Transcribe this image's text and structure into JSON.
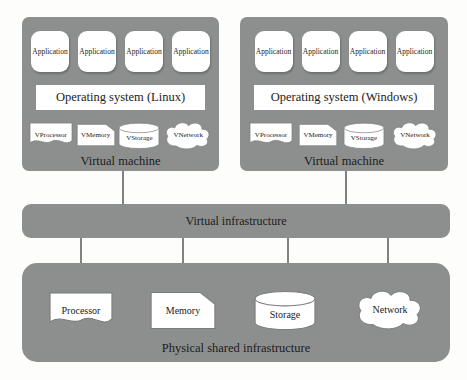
{
  "figure": {
    "vms": [
      {
        "apps": [
          "Application",
          "Application",
          "Application",
          "Application"
        ],
        "os": "Operating system (Linux)",
        "resources": [
          {
            "label": "VProcessor",
            "shape": "wave"
          },
          {
            "label": "VMemory",
            "shape": "card"
          },
          {
            "label": "VStorage",
            "shape": "cylinder"
          },
          {
            "label": "VNetwork",
            "shape": "cloud"
          }
        ],
        "caption": "Virtual machine"
      },
      {
        "apps": [
          "Application",
          "Application",
          "Application",
          "Application"
        ],
        "os": "Operating system (Windows)",
        "resources": [
          {
            "label": "VProcessor",
            "shape": "wave"
          },
          {
            "label": "VMemory",
            "shape": "card"
          },
          {
            "label": "VStorage",
            "shape": "cylinder"
          },
          {
            "label": "VNetwork",
            "shape": "cloud"
          }
        ],
        "caption": "Virtual machine"
      }
    ],
    "virtual_infrastructure": {
      "label": "Virtual infrastructure"
    },
    "physical": {
      "resources": [
        {
          "label": "Processor",
          "shape": "wave"
        },
        {
          "label": "Memory",
          "shape": "card"
        },
        {
          "label": "Storage",
          "shape": "cylinder"
        },
        {
          "label": "Network",
          "shape": "cloud"
        }
      ],
      "caption": "Physical shared infrastructure"
    },
    "colors": {
      "panel_gray": "#8d8f8e",
      "shape_fill": "#ffffff",
      "shape_outline": "#7b7d7c",
      "connector": "#7f8281",
      "text": "#1c1c1c"
    }
  }
}
